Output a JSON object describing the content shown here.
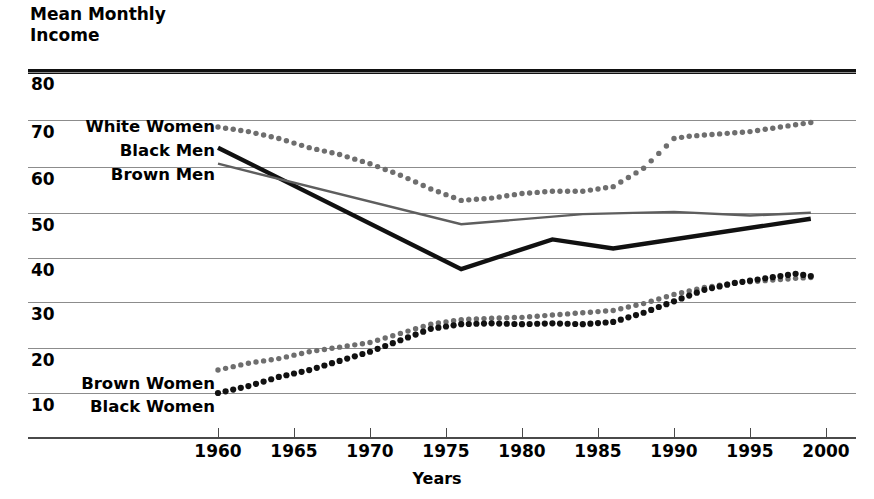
{
  "chart_data": {
    "type": "line",
    "title": "Mean Monthly Income",
    "xlabel": "Years",
    "ylabel": "Mean Monthly Income",
    "xlim": [
      1958,
      2001
    ],
    "ylim": [
      0,
      84
    ],
    "grid": true,
    "legend_position": "inline-left",
    "y_ticks": [
      80,
      70,
      60,
      50,
      40,
      30,
      20,
      10
    ],
    "x_ticks": [
      1960,
      1965,
      1970,
      1975,
      1980,
      1985,
      1990,
      1995,
      2000
    ],
    "series": [
      {
        "name": "White Women",
        "style": "dotted",
        "color": "#6e6e6e",
        "x": [
          1960,
          1962,
          1964,
          1966,
          1968,
          1970,
          1972,
          1974,
          1976,
          1978,
          1980,
          1982,
          1984,
          1986,
          1988,
          1990,
          1991,
          1993,
          1995,
          1997,
          1999
        ],
        "values": [
          68.0,
          67.0,
          65.5,
          63.5,
          62.0,
          60.0,
          57.5,
          54.5,
          52.0,
          52.5,
          53.5,
          54.0,
          54.0,
          55.0,
          59.0,
          65.5,
          66.0,
          66.5,
          67.0,
          68.0,
          69.0
        ]
      },
      {
        "name": "Black Men",
        "style": "solid-thick",
        "color": "#111111",
        "x": [
          1960,
          1976,
          1982,
          1986,
          1999
        ],
        "values": [
          63.5,
          37.0,
          43.5,
          41.5,
          48.0
        ]
      },
      {
        "name": "Brown Men",
        "style": "solid-thin",
        "color": "#5e5e5e",
        "x": [
          1960,
          1976,
          1984,
          1990,
          1995,
          1999
        ],
        "values": [
          60.0,
          46.8,
          49.0,
          49.5,
          48.7,
          49.3
        ]
      },
      {
        "name": "Brown Women",
        "style": "dotted",
        "color": "#6e6e6e",
        "x": [
          1960,
          1962,
          1964,
          1966,
          1968,
          1970,
          1972,
          1974,
          1976,
          1978,
          1980,
          1982,
          1984,
          1986,
          1988,
          1990,
          1992,
          1994,
          1996,
          1998,
          1999
        ],
        "values": [
          15.0,
          16.5,
          17.5,
          19.0,
          20.0,
          21.0,
          23.0,
          25.0,
          26.0,
          26.3,
          26.5,
          27.0,
          27.5,
          28.0,
          29.5,
          31.5,
          33.0,
          34.0,
          34.5,
          35.0,
          35.2
        ]
      },
      {
        "name": "Black Women",
        "style": "dotted-bold",
        "color": "#111111",
        "x": [
          1960,
          1962,
          1964,
          1966,
          1968,
          1970,
          1972,
          1974,
          1976,
          1978,
          1980,
          1982,
          1984,
          1986,
          1988,
          1990,
          1992,
          1994,
          1996,
          1998,
          1999
        ],
        "values": [
          10.0,
          11.5,
          13.5,
          15.0,
          17.0,
          19.0,
          21.5,
          24.0,
          25.0,
          25.2,
          25.0,
          25.2,
          25.0,
          25.5,
          27.5,
          30.0,
          32.5,
          34.0,
          35.0,
          36.0,
          35.5
        ]
      }
    ]
  },
  "labels": {
    "white_women": "White Women",
    "black_men": "Black Men",
    "brown_men": "Brown Men",
    "brown_women": "Brown Women",
    "black_women": "Black Women",
    "title_line1": "Mean Monthly",
    "title_line2": "Income",
    "xaxis_title": "Years",
    "y80": "80",
    "y70": "70",
    "y60": "60",
    "y50": "50",
    "y40": "40",
    "y30": "30",
    "y20": "20",
    "y10": "10",
    "x1960": "1960",
    "x1965": "1965",
    "x1970": "1970",
    "x1975": "1975",
    "x1980": "1980",
    "x1985": "1985",
    "x1990": "1990",
    "x1995": "1995",
    "x2000": "2000"
  },
  "colors": {
    "ink": "#111111",
    "grid": "#8c8c8c",
    "gray_series": "#5e5e5e",
    "dot_gray": "#6e6e6e"
  }
}
